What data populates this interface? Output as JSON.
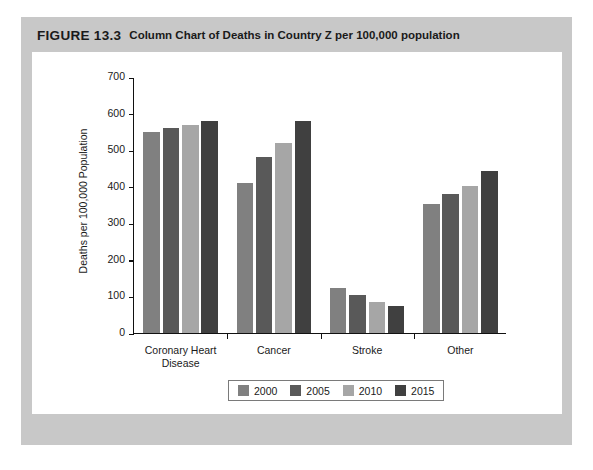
{
  "figure": {
    "label": "FIGURE 13.3",
    "caption": "Column Chart of Deaths in Country Z per 100,000 population"
  },
  "chart_data": {
    "type": "bar",
    "title": "Column Chart of Deaths in Country Z per 100,000 population",
    "xlabel": "",
    "ylabel": "Deaths per 100,000 Population",
    "ylim": [
      0,
      700
    ],
    "ytick_step": 100,
    "yticks": [
      0,
      100,
      200,
      300,
      400,
      500,
      600,
      700
    ],
    "grid": false,
    "legend_position": "bottom",
    "categories": [
      "Coronary Heart Disease",
      "Cancer",
      "Stroke",
      "Other"
    ],
    "series": [
      {
        "name": "2000",
        "color": "#808080",
        "values": [
          550,
          410,
          123,
          353
        ]
      },
      {
        "name": "2005",
        "color": "#595959",
        "values": [
          560,
          480,
          103,
          380
        ]
      },
      {
        "name": "2010",
        "color": "#a6a6a6",
        "values": [
          570,
          520,
          85,
          403
        ]
      },
      {
        "name": "2015",
        "color": "#404040",
        "values": [
          580,
          580,
          75,
          442
        ]
      }
    ]
  },
  "colors": {
    "page_panel": "#c8c8c8",
    "card": "#ffffff",
    "axis": "#111111",
    "text": "#1a1a1a"
  }
}
